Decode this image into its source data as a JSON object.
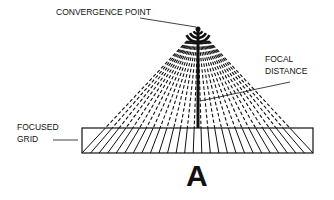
{
  "figure": {
    "panel_letter": "A",
    "labels": {
      "convergence_point": "CONVERGENCE POINT",
      "focal_line1": "FOCAL",
      "focal_line2": "DISTANCE",
      "grid_line1": "FOCUSED",
      "grid_line2": "GRID"
    },
    "colors": {
      "ink": "#111111",
      "background": "#ffffff"
    },
    "geometry": {
      "convergence": [
        198,
        29
      ],
      "grid": {
        "x": 82,
        "y": 128,
        "width": 231,
        "height": 25
      },
      "strip_count": 27
    }
  }
}
